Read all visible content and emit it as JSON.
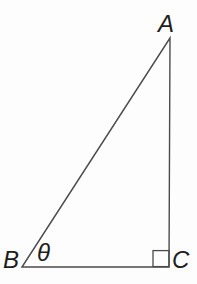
{
  "figure": {
    "type": "right-triangle-diagram",
    "vertices": [
      {
        "label": "A",
        "position": "top-right"
      },
      {
        "label": "B",
        "position": "bottom-left"
      },
      {
        "label": "C",
        "position": "bottom-right"
      }
    ],
    "angle": {
      "label": "θ",
      "at_vertex": "B"
    },
    "right_angle_marker_at": "C"
  },
  "labels": {
    "A": "A",
    "B": "B",
    "C": "C",
    "theta": "θ"
  },
  "colors": {
    "line": "#4b4b4b",
    "text": "#1e1e1e",
    "background": "#fdfdfd"
  }
}
